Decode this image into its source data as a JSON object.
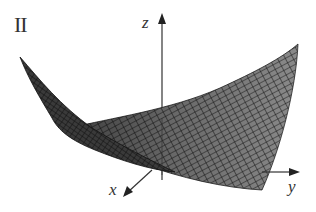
{
  "figure": {
    "panel_label": "II",
    "axes": {
      "x_label": "x",
      "y_label": "y",
      "z_label": "z"
    },
    "surface": {
      "description": "3D mesh surface (saddle-like / parabolic trough) rendered with dark gray wireframe grid",
      "fill_color": "#8a8a8a",
      "mesh_color": "#1a1a1a"
    },
    "colors": {
      "axis": "#333333",
      "background": "#ffffff"
    }
  }
}
